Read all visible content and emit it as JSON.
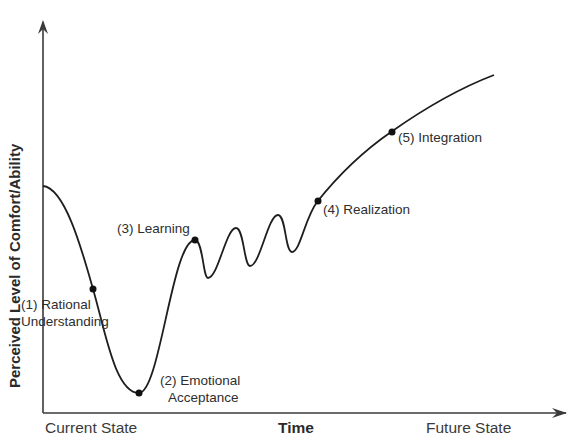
{
  "diagram": {
    "title": "",
    "y_axis_label": "Perceived Level of Comfort/Ability",
    "x_axis": {
      "left_label": "Current State",
      "center_label": "Time",
      "right_label": "Future State"
    },
    "stages": [
      {
        "id": 1,
        "line1": "(1)  Rational",
        "line2": "Understanding"
      },
      {
        "id": 2,
        "line1": "(2)  Emotional",
        "line2": "Acceptance"
      },
      {
        "id": 3,
        "line1": "(3)  Learning"
      },
      {
        "id": 4,
        "line1": "(4)  Realization"
      },
      {
        "id": 5,
        "line1": "(5)  Integration"
      }
    ],
    "colors": {
      "line": "#1e1e1e",
      "axis": "#3a3a3a",
      "background": "#ffffff"
    }
  }
}
